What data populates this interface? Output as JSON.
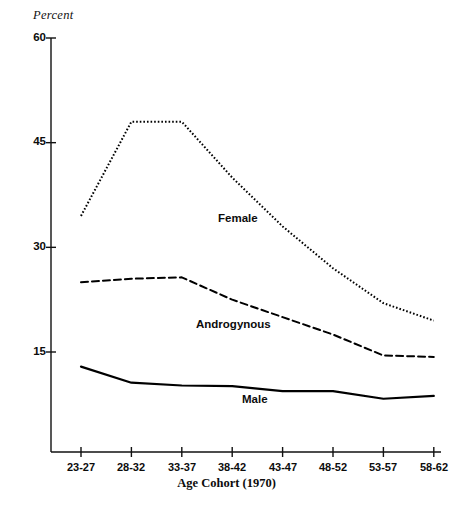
{
  "figure": {
    "y_axis_unit": "Percent",
    "x_axis_title": "Age Cohort (1970)"
  },
  "chart_data": {
    "type": "line",
    "title": "",
    "subtitle": "",
    "xlabel": "Age Cohort (1970)",
    "ylabel": "Percent",
    "categories": [
      "23-27",
      "28-32",
      "33-37",
      "38-42",
      "43-47",
      "48-52",
      "53-57",
      "58-62"
    ],
    "ytick_labels": [
      "60",
      "45",
      "30",
      "15"
    ],
    "ytick_values": [
      60,
      45,
      30,
      15
    ],
    "ylim": [
      0,
      60
    ],
    "grid": false,
    "legend_position": "inline-annotations",
    "series": [
      {
        "name": "Female",
        "line_style": "dotted",
        "color": "#000000",
        "values": [
          34.5,
          48.0,
          48.0,
          40.0,
          33.0,
          27.0,
          22.0,
          19.5
        ]
      },
      {
        "name": "Androgynous",
        "line_style": "dashed",
        "color": "#000000",
        "values": [
          25.0,
          25.5,
          25.7,
          22.5,
          20.0,
          17.5,
          14.5,
          14.3
        ]
      },
      {
        "name": "Male",
        "line_style": "solid",
        "color": "#000000",
        "values": [
          12.9,
          10.6,
          10.2,
          10.1,
          9.4,
          9.4,
          8.3,
          8.7
        ]
      }
    ],
    "annotations": [
      {
        "text": "Female",
        "series": "Female"
      },
      {
        "text": "Androgynous",
        "series": "Androgynous"
      },
      {
        "text": "Male",
        "series": "Male"
      }
    ]
  }
}
